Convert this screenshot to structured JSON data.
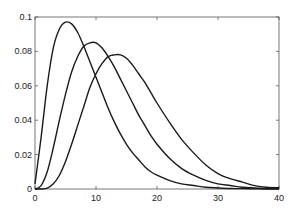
{
  "chart_data": {
    "type": "line",
    "title": "",
    "xlabel": "",
    "ylabel": "",
    "xlim": [
      0,
      40
    ],
    "ylim": [
      0,
      0.1
    ],
    "xticks": [
      0,
      10,
      20,
      30,
      40
    ],
    "yticks": [
      0,
      0.02,
      0.04,
      0.06,
      0.08,
      0.1
    ],
    "xtick_labels": [
      "0",
      "10",
      "20",
      "30",
      "40"
    ],
    "ytick_labels": [
      "0",
      "0.02",
      "0.04",
      "0.06",
      "0.08",
      "0.1"
    ],
    "grid": false,
    "legend": null,
    "line_color": "#1a1a1a",
    "x": [
      0,
      1,
      2,
      3,
      4,
      5,
      6,
      7,
      8,
      9,
      10,
      11,
      12,
      13,
      14,
      15,
      16,
      17,
      18,
      19,
      20,
      22,
      24,
      26,
      28,
      30,
      32,
      34,
      36,
      38,
      40
    ],
    "series": [
      {
        "name": "curve-1",
        "peak": {
          "x": 6,
          "y": 0.096
        },
        "values": [
          0.003,
          0.03,
          0.06,
          0.082,
          0.093,
          0.097,
          0.096,
          0.091,
          0.083,
          0.074,
          0.065,
          0.056,
          0.047,
          0.039,
          0.032,
          0.026,
          0.021,
          0.017,
          0.013,
          0.01,
          0.008,
          0.005,
          0.003,
          0.002,
          0.001,
          0.0006,
          0.0003,
          0.0002,
          0.0001,
          0.0,
          0.0
        ]
      },
      {
        "name": "curve-2",
        "peak": {
          "x": 10,
          "y": 0.085
        },
        "values": [
          0.0,
          0.002,
          0.01,
          0.024,
          0.04,
          0.055,
          0.068,
          0.077,
          0.083,
          0.085,
          0.085,
          0.082,
          0.077,
          0.071,
          0.064,
          0.057,
          0.05,
          0.043,
          0.037,
          0.031,
          0.026,
          0.018,
          0.012,
          0.008,
          0.005,
          0.003,
          0.002,
          0.001,
          0.0006,
          0.0003,
          0.0002
        ]
      },
      {
        "name": "curve-3",
        "peak": {
          "x": 14,
          "y": 0.078
        },
        "values": [
          0.0,
          0.0,
          0.0005,
          0.003,
          0.008,
          0.016,
          0.026,
          0.037,
          0.048,
          0.059,
          0.067,
          0.073,
          0.077,
          0.078,
          0.078,
          0.076,
          0.072,
          0.067,
          0.062,
          0.056,
          0.05,
          0.039,
          0.029,
          0.021,
          0.014,
          0.009,
          0.006,
          0.004,
          0.002,
          0.001,
          0.0007
        ]
      }
    ]
  }
}
